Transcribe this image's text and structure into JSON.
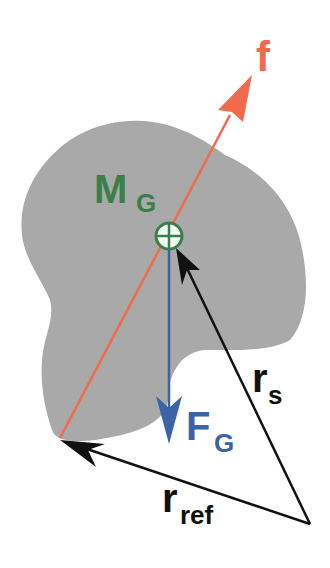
{
  "diagram": {
    "type": "free-body / rigid body force diagram",
    "labels": {
      "force": "f",
      "mass_main": "M",
      "mass_sub": "G",
      "gravity_main": "F",
      "gravity_sub": "G",
      "rs_main": "r",
      "rs_sub": "s",
      "rref_main": "r",
      "rref_sub": "ref"
    },
    "colors": {
      "body_fill": "#a9a9a9",
      "force_f": "#f26a4b",
      "mass_label": "#3a7f4a",
      "gravity": "#3b64a6",
      "vectors": "#111111",
      "background": "#ffffff"
    },
    "elements": [
      {
        "name": "rigid-body",
        "kind": "irregular gray blob"
      },
      {
        "name": "center-of-mass-marker",
        "kind": "circle with crosshair",
        "label": "M_G"
      },
      {
        "name": "force-f-arrow",
        "from": "lower-left body point",
        "to": "upper right",
        "label": "f"
      },
      {
        "name": "gravity-arrow",
        "from": "center of mass",
        "direction": "down",
        "label": "F_G"
      },
      {
        "name": "rs-vector",
        "from": "reference point (bottom right)",
        "to": "center of mass",
        "label": "r_s"
      },
      {
        "name": "rref-vector",
        "from": "reference point (bottom right)",
        "to": "force application point",
        "label": "r_ref"
      }
    ]
  }
}
